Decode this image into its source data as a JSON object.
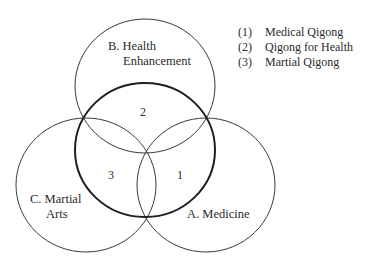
{
  "diagram": {
    "type": "venn",
    "circles": [
      {
        "id": "B",
        "label_line1": "B. Health",
        "label_line2": "Enhancement"
      },
      {
        "id": "C",
        "label_line1": "C. Martial",
        "label_line2": "Arts"
      },
      {
        "id": "A",
        "label_line1": "A. Medicine"
      }
    ],
    "regions": [
      {
        "number": "2",
        "meaning": "Qigong for Health"
      },
      {
        "number": "3",
        "meaning": "Martial Qigong"
      },
      {
        "number": "1",
        "meaning": "Medical Qigong"
      }
    ],
    "legend": [
      {
        "key": "(1)",
        "text": "Medical Qigong"
      },
      {
        "key": "(2)",
        "text": "Qigong for Health"
      },
      {
        "key": "(3)",
        "text": "Martial Qigong"
      }
    ],
    "colors": {
      "line": "#333333",
      "background": "#ffffff"
    }
  }
}
